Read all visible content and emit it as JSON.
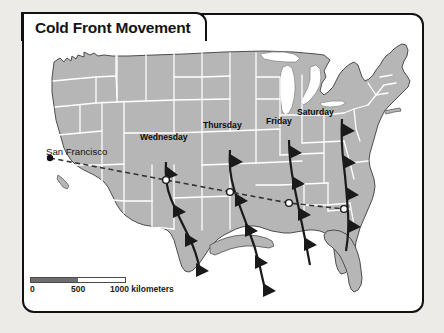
{
  "figure": {
    "title": "Cold Front Movement",
    "background_color": "#edebe7",
    "panel_color": "#ffffff",
    "border_color": "#111111"
  },
  "map": {
    "land_fill": "#b6b6b6",
    "land_outline": "#4d4d4d",
    "state_border_color": "#ffffff",
    "lake_fill": "#ffffff",
    "front_color": "#1a1a1a",
    "trajectory_color": "#333333"
  },
  "city": {
    "name": "San Francisco",
    "marker": "city-dot"
  },
  "fronts": [
    {
      "label": "Wednesday",
      "label_x": 140,
      "label_y": 137
    },
    {
      "label": "Thursday",
      "label_x": 203,
      "label_y": 126
    },
    {
      "label": "Friday",
      "label_x": 268,
      "label_y": 122
    },
    {
      "label": "Saturday",
      "label_x": 299,
      "label_y": 113
    }
  ],
  "scale": {
    "unit_label": "1000 kilometers",
    "tick_0": "0",
    "tick_500": "500",
    "tick_1000": "1000 kilometers",
    "fill_color": "#6e6e6e"
  }
}
